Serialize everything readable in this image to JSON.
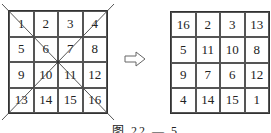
{
  "left_grid": {
    "label": "original 4x4 grid",
    "cells": [
      "1",
      "2",
      "3",
      "4",
      "5",
      "6",
      "7",
      "8",
      "9",
      "10",
      "11",
      "12",
      "13",
      "14",
      "15",
      "16"
    ],
    "diagonals": "both diagonals drawn, extending beyond corners"
  },
  "arrow": {
    "icon": "right-arrow-icon",
    "symbol": "⇨"
  },
  "right_grid": {
    "label": "magic square",
    "cells": [
      "16",
      "2",
      "3",
      "13",
      "5",
      "11",
      "10",
      "8",
      "9",
      "7",
      "6",
      "12",
      "4",
      "14",
      "15",
      "1"
    ]
  },
  "caption": "图 22 — 5"
}
